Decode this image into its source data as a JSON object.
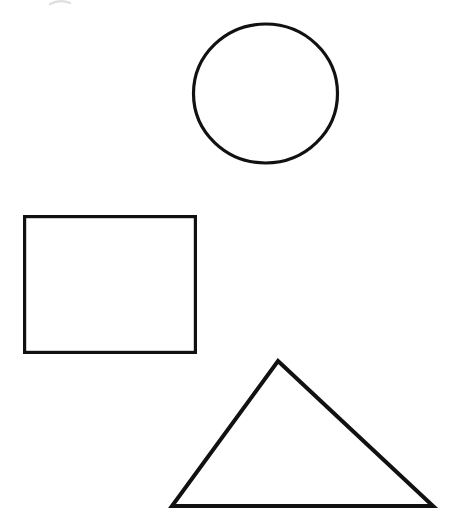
{
  "page": {
    "background_color": "#ffffff",
    "width": 455,
    "height": 531
  },
  "shapes": [
    {
      "id": "circle",
      "name": "circle",
      "label": "Circle",
      "type": "ellipse",
      "stroke_color": "#111111",
      "stroke_width": 3.2,
      "fill": "none",
      "center_x": 265.5,
      "center_y": 93.5,
      "radius_x": 72,
      "radius_y": 69.5,
      "bounds": {
        "left": 193,
        "top": 24,
        "right": 338,
        "bottom": 163,
        "width": 145,
        "height": 139
      }
    },
    {
      "id": "rectangle",
      "name": "rectangle",
      "label": "Rectangle",
      "type": "rect",
      "stroke_color": "#111111",
      "stroke_width": 3.2,
      "fill": "none",
      "x": 23,
      "y": 215,
      "width": 174,
      "height": 139,
      "bounds": {
        "left": 23,
        "top": 215,
        "right": 197,
        "bottom": 354,
        "width": 174,
        "height": 139
      }
    },
    {
      "id": "triangle",
      "name": "triangle",
      "label": "Triangle",
      "type": "polygon",
      "stroke_color": "#111111",
      "stroke_width": 4,
      "fill": "none",
      "points": "278,361 433,506 172,506",
      "vertices": [
        {
          "label": "apex",
          "x": 278,
          "y": 361
        },
        {
          "label": "base-right",
          "x": 433,
          "y": 506
        },
        {
          "label": "base-left",
          "x": 172,
          "y": 506
        }
      ],
      "bounds": {
        "left": 172,
        "top": 361,
        "right": 433,
        "bottom": 506,
        "width": 261,
        "height": 145
      }
    }
  ],
  "artifacts": [
    {
      "id": "scan-smudge",
      "name": "scan-smudge",
      "label": "Faint scan smudge",
      "type": "arc",
      "stroke_color": "#d8d8d8",
      "stroke_width": 2.2,
      "path": "M 50 4 Q 60 -1 70 3",
      "opacity": 0.85
    }
  ]
}
